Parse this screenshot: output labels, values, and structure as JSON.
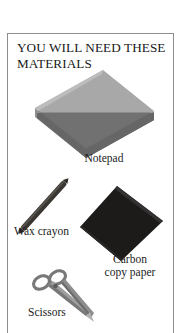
{
  "page": {
    "heading": "YOU WILL NEED THESE MATERIALS",
    "background_color": "#ffffff",
    "frame_border_color": "#8d8d8d"
  },
  "materials": [
    {
      "id": "notepad",
      "caption": "Notepad",
      "icon": "notepad-icon",
      "colors": {
        "top_face": "#a3a3a3",
        "side_band": "#5d5d5d",
        "front_face": "#9b9b9b",
        "edge": "#7a7a7a"
      }
    },
    {
      "id": "wax-crayon",
      "caption": "Wax crayon",
      "icon": "wax-crayon-icon",
      "colors": {
        "body": "#3a3733",
        "highlight": "#55514b"
      }
    },
    {
      "id": "carbon-copy-paper",
      "caption": "Carbon\ncopy paper",
      "icon": "carbon-copy-paper-icon",
      "colors": {
        "sheet": "#1c1b19",
        "edge": "#34322f"
      }
    },
    {
      "id": "scissors",
      "caption": "Scissors",
      "icon": "scissors-icon",
      "colors": {
        "blade": "#9a9a9a",
        "handle": "#6e6e6e",
        "outline": "#4e4e4e"
      }
    }
  ]
}
